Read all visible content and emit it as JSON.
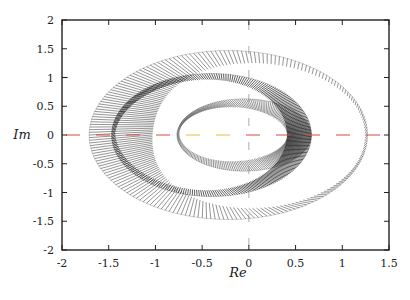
{
  "chart_data": {
    "type": "line",
    "title": "",
    "xlabel": "Re",
    "ylabel": "Im",
    "xlim": [
      -2,
      1.5
    ],
    "ylim": [
      -2,
      2
    ],
    "xticks": [
      -2,
      -1.5,
      -1,
      -0.5,
      0,
      0.5,
      1,
      1.5
    ],
    "yticks": [
      -2,
      -1.5,
      -1,
      -0.5,
      0,
      0.5,
      1,
      1.5,
      2
    ],
    "xtick_labels": [
      "-2",
      "-1.5",
      "-1",
      "-0.5",
      "0",
      "0.5",
      "1",
      "1.5"
    ],
    "ytick_labels": [
      "-2",
      "-1.5",
      "-1",
      "-0.5",
      "0",
      "0.5",
      "1",
      "1.5",
      "2"
    ],
    "grid": false,
    "legend": "none",
    "reference_lines": [
      {
        "name": "real-axis",
        "orientation": "horizontal",
        "value": 0,
        "style": "dashed",
        "colors": [
          "#d84a3a",
          "#e0c040"
        ]
      },
      {
        "name": "imag-axis",
        "orientation": "vertical",
        "value": 0,
        "style": "dashed",
        "color": "#888888"
      }
    ],
    "series": [
      {
        "name": "outer-hatched-band",
        "shape": "ellipse-band",
        "center": [
          -0.22,
          0
        ],
        "outer_radii": [
          1.49,
          1.47
        ],
        "inner_radii_left": [
          1.18,
          1.22
        ],
        "right_extent": 1.27,
        "left_extent": -1.71,
        "top_extent": 1.47,
        "color": "#1a1a1a",
        "style": "hatched"
      },
      {
        "name": "middle-dense-band",
        "shape": "ellipse-band",
        "center": [
          -0.4,
          0
        ],
        "outer_radii": [
          1.07,
          1.07
        ],
        "inner_radii": [
          0.95,
          1.0
        ],
        "right_extent": 0.67,
        "left_extent": -1.4,
        "color": "#000000",
        "style": "dense"
      },
      {
        "name": "inner-hatched-band",
        "shape": "ellipse-band",
        "center": [
          -0.05,
          0
        ],
        "outer_radii": [
          0.72,
          0.63
        ],
        "inner_radii": [
          0.6,
          0.5
        ],
        "right_extent": 0.67,
        "left_extent": -0.75,
        "top_extent": 0.63,
        "color": "#1a1a1a",
        "style": "hatched"
      }
    ],
    "annotations": [
      {
        "name": "green-marker-y1",
        "x": -2,
        "y": 1,
        "color": "#3aa040"
      }
    ]
  }
}
